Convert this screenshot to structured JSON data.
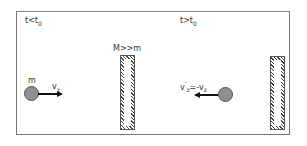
{
  "diagram": {
    "panels": [
      {
        "time_label": "t<t",
        "time_sub": "0",
        "mass_label": "m",
        "velocity_label": "v",
        "velocity_sub": "z",
        "wall_label": "M>>m",
        "direction": "right"
      },
      {
        "time_label": "t>t",
        "time_sub": "0",
        "velocity_label": "v",
        "velocity_sup": "'",
        "velocity_sub": "z",
        "velocity_rhs": "=-v",
        "velocity_rhs_sub": "z",
        "direction": "left"
      }
    ],
    "colors": {
      "ball": "#8f8f8f",
      "frame": "#777777",
      "arrow": "#111111",
      "wall_hatch": "#444444"
    }
  }
}
